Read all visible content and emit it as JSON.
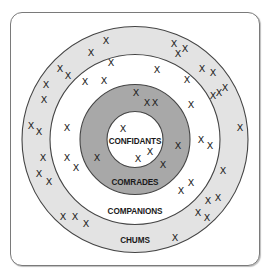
{
  "diagram": {
    "type": "concentric-circles",
    "center": [
      135,
      139.5
    ],
    "colors": {
      "chums_ring": "#e3e3e3",
      "companions_ring": "#ffffff",
      "comrades_ring": "#a8a8a8",
      "confidants_core": "#ffffff",
      "stroke": "#444444",
      "marker": "#222222"
    },
    "rings": [
      {
        "name": "chums",
        "label": "CHUMS",
        "radius": 113,
        "fill": "#e3e3e3",
        "label_y": 243
      },
      {
        "name": "companions",
        "label": "COMPANIONS",
        "radius": 85,
        "fill": "#ffffff",
        "label_y": 214
      },
      {
        "name": "comrades",
        "label": "COMRADES",
        "radius": 55,
        "fill": "#a8a8a8",
        "label_y": 185
      },
      {
        "name": "confidants",
        "label": "CONFIDANTS",
        "radius": 28,
        "fill": "#ffffff",
        "label_y": 144
      }
    ],
    "marker_glyph": "X",
    "markers": [
      {
        "ring": "chums",
        "x": 106,
        "y": 40
      },
      {
        "ring": "chums",
        "x": 91,
        "y": 52
      },
      {
        "ring": "chums",
        "x": 60,
        "y": 68
      },
      {
        "ring": "chums",
        "x": 68,
        "y": 75
      },
      {
        "ring": "chums",
        "x": 46,
        "y": 84
      },
      {
        "ring": "chums",
        "x": 44,
        "y": 99
      },
      {
        "ring": "chums",
        "x": 31,
        "y": 125
      },
      {
        "ring": "chums",
        "x": 39,
        "y": 131
      },
      {
        "ring": "chums",
        "x": 39,
        "y": 173
      },
      {
        "ring": "chums",
        "x": 49,
        "y": 181
      },
      {
        "ring": "chums",
        "x": 63,
        "y": 216
      },
      {
        "ring": "chums",
        "x": 75,
        "y": 216
      },
      {
        "ring": "chums",
        "x": 86,
        "y": 223
      },
      {
        "ring": "chums",
        "x": 174,
        "y": 43
      },
      {
        "ring": "chums",
        "x": 178,
        "y": 53
      },
      {
        "ring": "chums",
        "x": 185,
        "y": 48
      },
      {
        "ring": "chums",
        "x": 202,
        "y": 68
      },
      {
        "ring": "chums",
        "x": 213,
        "y": 72
      },
      {
        "ring": "chums",
        "x": 213,
        "y": 95
      },
      {
        "ring": "chums",
        "x": 219,
        "y": 92
      },
      {
        "ring": "chums",
        "x": 225,
        "y": 87
      },
      {
        "ring": "chums",
        "x": 240,
        "y": 127
      },
      {
        "ring": "chums",
        "x": 223,
        "y": 170
      },
      {
        "ring": "chums",
        "x": 208,
        "y": 200
      },
      {
        "ring": "chums",
        "x": 218,
        "y": 197
      },
      {
        "ring": "chums",
        "x": 198,
        "y": 212
      },
      {
        "ring": "chums",
        "x": 207,
        "y": 217
      },
      {
        "ring": "chums",
        "x": 175,
        "y": 237
      },
      {
        "ring": "companions",
        "x": 111,
        "y": 62
      },
      {
        "ring": "companions",
        "x": 85,
        "y": 81
      },
      {
        "ring": "companions",
        "x": 104,
        "y": 80
      },
      {
        "ring": "companions",
        "x": 67,
        "y": 127
      },
      {
        "ring": "companions",
        "x": 43,
        "y": 157
      },
      {
        "ring": "companions",
        "x": 67,
        "y": 157
      },
      {
        "ring": "companions",
        "x": 76,
        "y": 167
      },
      {
        "ring": "companions",
        "x": 157,
        "y": 69
      },
      {
        "ring": "companions",
        "x": 187,
        "y": 79
      },
      {
        "ring": "companions",
        "x": 191,
        "y": 104
      },
      {
        "ring": "companions",
        "x": 201,
        "y": 139
      },
      {
        "ring": "companions",
        "x": 210,
        "y": 145
      },
      {
        "ring": "companions",
        "x": 191,
        "y": 182
      },
      {
        "ring": "companions",
        "x": 181,
        "y": 190
      },
      {
        "ring": "comrades",
        "x": 136,
        "y": 92
      },
      {
        "ring": "comrades",
        "x": 147,
        "y": 102
      },
      {
        "ring": "comrades",
        "x": 155,
        "y": 102
      },
      {
        "ring": "comrades",
        "x": 178,
        "y": 145
      },
      {
        "ring": "comrades",
        "x": 97,
        "y": 157
      },
      {
        "ring": "comrades",
        "x": 163,
        "y": 164
      },
      {
        "ring": "confidants",
        "x": 123,
        "y": 128
      },
      {
        "ring": "confidants",
        "x": 150,
        "y": 151
      },
      {
        "ring": "confidants",
        "x": 138,
        "y": 158
      }
    ]
  }
}
